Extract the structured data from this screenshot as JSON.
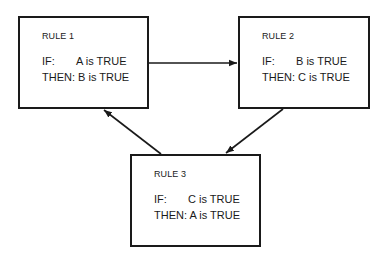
{
  "diagram": {
    "type": "cyclic rule chain",
    "rules": [
      {
        "id": 1,
        "title": "RULE 1",
        "if_label": "IF:",
        "if_value": "A is TRUE",
        "then_label": "THEN:",
        "then_value": "B is TRUE"
      },
      {
        "id": 2,
        "title": "RULE 2",
        "if_label": "IF:",
        "if_value": "B is TRUE",
        "then_label": "THEN:",
        "then_value": "C is TRUE"
      },
      {
        "id": 3,
        "title": "RULE 3",
        "if_label": "IF:",
        "if_value": "C is TRUE",
        "then_label": "THEN:",
        "then_value": "A is TRUE"
      }
    ],
    "edges": [
      {
        "from": "RULE 1",
        "to": "RULE 2"
      },
      {
        "from": "RULE 2",
        "to": "RULE 3"
      },
      {
        "from": "RULE 3",
        "to": "RULE 1"
      }
    ]
  }
}
